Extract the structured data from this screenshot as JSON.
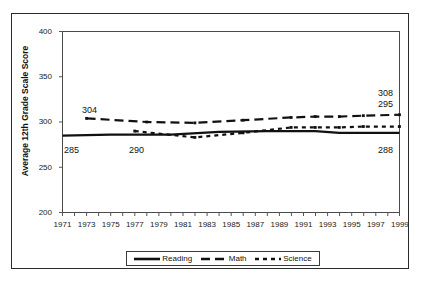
{
  "chart_data": {
    "type": "line",
    "title": "",
    "xlabel": "",
    "ylabel": "Average 12th Grade Scale Score",
    "ylim": [
      200,
      400
    ],
    "xlim": [
      1971,
      1999
    ],
    "yticks": [
      200,
      250,
      300,
      350,
      400
    ],
    "xticks": [
      1971,
      1973,
      1975,
      1977,
      1979,
      1981,
      1983,
      1985,
      1987,
      1989,
      1991,
      1993,
      1995,
      1997,
      1999
    ],
    "grid": false,
    "legend_position": "bottom",
    "series": [
      {
        "name": "Reading",
        "style": "solid",
        "x": [
          1971,
          1975,
          1980,
          1984,
          1988,
          1990,
          1992,
          1994,
          1996,
          1999
        ],
        "values": [
          285,
          286,
          286,
          289,
          290,
          290,
          290,
          288,
          288,
          288
        ]
      },
      {
        "name": "Math",
        "style": "dashed",
        "x": [
          1973,
          1978,
          1982,
          1986,
          1990,
          1992,
          1994,
          1996,
          1999
        ],
        "values": [
          304,
          300,
          299,
          302,
          305,
          306,
          306,
          307,
          308
        ]
      },
      {
        "name": "Science",
        "style": "dotted",
        "x": [
          1977,
          1982,
          1986,
          1990,
          1992,
          1994,
          1996,
          1999
        ],
        "values": [
          290,
          283,
          288,
          294,
          294,
          294,
          295,
          295
        ]
      }
    ],
    "annotations": [
      {
        "text": "304",
        "series": "Math",
        "year": 1973,
        "value": 304
      },
      {
        "text": "308",
        "series": "Math",
        "year": 1999,
        "value": 308
      },
      {
        "text": "285",
        "series": "Reading",
        "year": 1971,
        "value": 285
      },
      {
        "text": "288",
        "series": "Reading",
        "year": 1999,
        "value": 288
      },
      {
        "text": "290",
        "series": "Science",
        "year": 1977,
        "value": 290
      },
      {
        "text": "295",
        "series": "Science",
        "year": 1999,
        "value": 295
      }
    ]
  },
  "axis": {
    "y_label": "Average 12th Grade Scale Score",
    "y_ticks": [
      "400",
      "350",
      "300",
      "250",
      "200"
    ],
    "x_ticks": [
      "1971",
      "1973",
      "1975",
      "1977",
      "1979",
      "1981",
      "1983",
      "1985",
      "1987",
      "1989",
      "1991",
      "1993",
      "1995",
      "1997",
      "1999"
    ]
  },
  "annotations": {
    "math_start": "304",
    "math_end": "308",
    "reading_start": "285",
    "reading_end": "288",
    "science_start": "290",
    "science_end": "295"
  },
  "legend": {
    "items": [
      {
        "label": "Reading",
        "style": "solid"
      },
      {
        "label": "Math",
        "style": "dashed"
      },
      {
        "label": "Science",
        "style": "dotted"
      }
    ]
  },
  "colors": {
    "line": "#111111",
    "frame": "#2b2b2b",
    "background": "#ffffff"
  }
}
